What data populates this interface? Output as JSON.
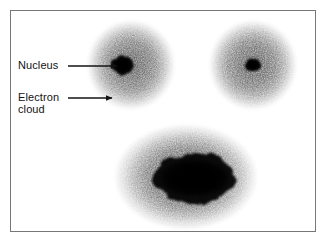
{
  "figure": {
    "background_color": "#ffffff",
    "border_color": "#77777a",
    "ink_color": "#131313"
  },
  "labels": [
    {
      "id": "nucleus",
      "text": "Nucleus",
      "x": 18,
      "y": 59
    },
    {
      "id": "electron-cloud",
      "text": "Electron\ncloud",
      "x": 18,
      "y": 91
    }
  ],
  "arrows": [
    {
      "id": "arrow-to-nucleus",
      "points_to": "nucleus",
      "x1": 68,
      "y1": 66,
      "x2": 117,
      "y2": 66
    },
    {
      "id": "arrow-to-electron-cloud",
      "points_to": "electron-cloud",
      "x1": 68,
      "y1": 98,
      "x2": 112,
      "y2": 98
    }
  ],
  "atoms": [
    {
      "id": "atom-top-left",
      "cloud": {
        "cx": 131,
        "cy": 65,
        "rx": 43,
        "ry": 44
      },
      "nucleus": {
        "cx": 123,
        "cy": 65,
        "rx": 9,
        "ry": 8
      },
      "nucleus_shape": "irregular-blob"
    },
    {
      "id": "atom-top-right",
      "cloud": {
        "cx": 253,
        "cy": 65,
        "rx": 43,
        "ry": 44
      },
      "nucleus": {
        "cx": 253,
        "cy": 65,
        "rx": 6,
        "ry": 6
      },
      "nucleus_shape": "round"
    },
    {
      "id": "atom-bottom",
      "cloud": {
        "cx": 186,
        "cy": 177,
        "rx": 71,
        "ry": 52
      },
      "nucleus": {
        "cx": 195,
        "cy": 178,
        "rx": 38,
        "ry": 21
      },
      "nucleus_shape": "elongated-ellipse"
    }
  ]
}
